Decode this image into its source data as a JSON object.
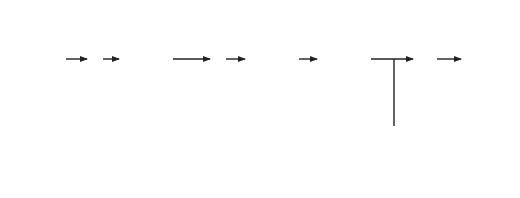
{
  "diagram": {
    "input": {
      "signal": "R(s)",
      "line1": "Position",
      "line2": "command",
      "line3": "(microns)"
    },
    "output": {
      "signal": "Y(s)",
      "line1": "Position"
    },
    "junctions": [
      {
        "id": "sum1",
        "plus": "+",
        "minus": "−"
      },
      {
        "id": "sum2",
        "plus": "+",
        "minus": "−"
      }
    ],
    "signals": {
      "u": "U(s)",
      "v": "V(s)",
      "v_label": "Velocity"
    },
    "blocks": {
      "position_controller": {
        "header_line1": "Position",
        "header_line2": "controller",
        "tf": "G1(s)",
        "tf_main": "G",
        "tf_sub": "1",
        "tf_arg": "(s)"
      },
      "velocity_controller": {
        "header_line1": "Velocity",
        "header_line2": "controller",
        "tf": "G2(s)",
        "tf_main": "G",
        "tf_sub": "2",
        "tf_arg": "(s)"
      },
      "actuator": {
        "header_line1": "Actuator",
        "header_line2": "and cutter",
        "tf": "G(s)"
      },
      "integrator": {
        "num": "1",
        "den": "s"
      },
      "tachometer": {
        "header": "Tachometer",
        "tf": "1"
      },
      "laser": {
        "header_line1": "Laser",
        "header_line2": "interferometer",
        "tf": "1"
      }
    },
    "colors": {
      "line": "#222222",
      "header_fill": "#d9d9d9",
      "faded_text": "#8a8a8a"
    }
  }
}
